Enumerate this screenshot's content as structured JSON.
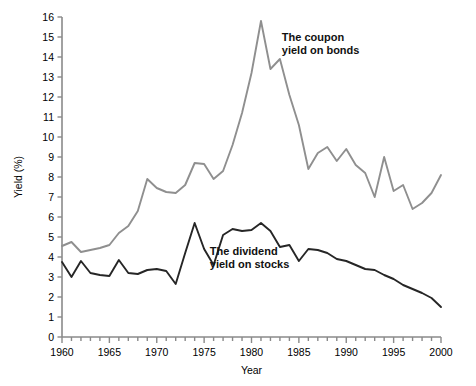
{
  "chart_data": {
    "type": "line",
    "title": "",
    "xlabel": "Year",
    "ylabel": "Yield (%)",
    "xlim": [
      1960,
      2000
    ],
    "ylim": [
      0,
      16
    ],
    "ytick_step": 1,
    "xtick_step": 1,
    "xtick_label_step": 5,
    "grid": false,
    "legend_position": "inline-annotation",
    "xticklabels": [
      "1960",
      "1965",
      "1970",
      "1975",
      "1980",
      "1985",
      "1990",
      "1995",
      "2000"
    ],
    "yticklabels": [
      "0",
      "1",
      "2",
      "3",
      "4",
      "5",
      "6",
      "7",
      "8",
      "9",
      "10",
      "11",
      "12",
      "13",
      "14",
      "15",
      "16"
    ],
    "annotations": [
      {
        "name": "bond-series-label",
        "text": "The coupon\nyield on bonds",
        "line1": "The coupon",
        "line2": "yield on bonds",
        "x": 1983.2,
        "y": 14.8
      },
      {
        "name": "stock-series-label",
        "text": "The dividend\nyield on stocks",
        "line1": "The dividend",
        "line2": "yield on stocks",
        "x": 1975.6,
        "y": 4.1
      }
    ],
    "x": [
      1960,
      1961,
      1962,
      1963,
      1964,
      1965,
      1966,
      1967,
      1968,
      1969,
      1970,
      1971,
      1972,
      1973,
      1974,
      1975,
      1976,
      1977,
      1978,
      1979,
      1980,
      1981,
      1982,
      1983,
      1984,
      1985,
      1986,
      1987,
      1988,
      1989,
      1990,
      1991,
      1992,
      1993,
      1994,
      1995,
      1996,
      1997,
      1998,
      1999,
      2000
    ],
    "series": [
      {
        "name": "The coupon yield on bonds",
        "color": "#8f8f8f",
        "values": [
          4.55,
          4.75,
          4.25,
          4.35,
          4.45,
          4.6,
          5.2,
          5.55,
          6.3,
          7.9,
          7.45,
          7.25,
          7.2,
          7.6,
          8.7,
          8.65,
          7.9,
          8.3,
          9.6,
          11.2,
          13.2,
          15.8,
          13.4,
          13.9,
          12.1,
          10.6,
          8.4,
          9.2,
          9.5,
          8.8,
          9.4,
          8.6,
          8.2,
          7.0,
          9.0,
          7.3,
          7.6,
          6.4,
          6.7,
          7.2,
          8.1
        ]
      },
      {
        "name": "The dividend yield on stocks",
        "color": "#262626",
        "values": [
          3.75,
          3.0,
          3.8,
          3.2,
          3.1,
          3.05,
          3.85,
          3.2,
          3.15,
          3.35,
          3.4,
          3.3,
          2.65,
          4.2,
          5.7,
          4.4,
          3.6,
          5.1,
          5.4,
          5.3,
          5.35,
          5.7,
          5.3,
          4.5,
          4.6,
          3.8,
          4.4,
          4.35,
          4.2,
          3.9,
          3.8,
          3.6,
          3.4,
          3.35,
          3.1,
          2.9,
          2.6,
          2.4,
          2.2,
          1.95,
          1.5
        ]
      }
    ]
  },
  "axes": {
    "x_axis_name": "x-axis",
    "y_axis_name": "y-axis"
  }
}
